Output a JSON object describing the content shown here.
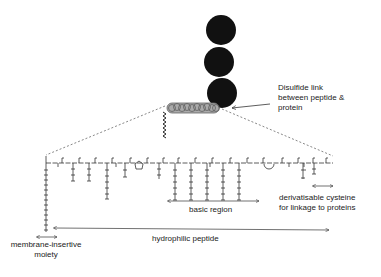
{
  "diagram": {
    "labels": {
      "disulfide": [
        "Disulfide link",
        "between peptide &",
        "protein"
      ],
      "cysteine": [
        "derivatisable cysteine",
        "for linkage to proteins"
      ],
      "basic_region": "basic region",
      "hydrophilic": "hydrophilic peptide",
      "membrane": [
        "membrane-insertive",
        "moiety"
      ]
    },
    "colors": {
      "protein": "#111111",
      "peptide_helix": "#9a9a9a",
      "line": "#333333"
    },
    "protein_domains": 3
  }
}
